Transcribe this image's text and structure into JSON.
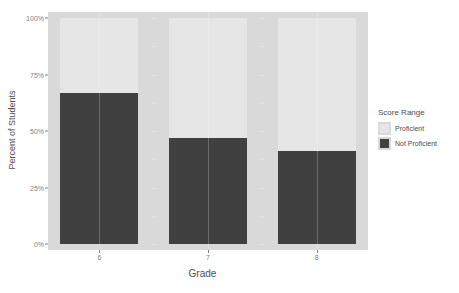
{
  "chart_data": {
    "type": "bar",
    "title": "",
    "xlabel": "Grade",
    "ylabel": "Percent of Students",
    "categories": [
      "6",
      "7",
      "8"
    ],
    "ylim": [
      0,
      100
    ],
    "y_ticks": [
      {
        "value": 0,
        "label": "0%"
      },
      {
        "value": 25,
        "label": "25%"
      },
      {
        "value": 50,
        "label": "50%"
      },
      {
        "value": 75,
        "label": "75%"
      },
      {
        "value": 100,
        "label": "100%"
      }
    ],
    "stacked": true,
    "grid": true,
    "legend_position": "right",
    "legend_title": "Score Range",
    "series": [
      {
        "name": "Proficient",
        "color": "#e6e6e6",
        "values": [
          33,
          53,
          59
        ]
      },
      {
        "name": "Not Proficient",
        "color": "#404040",
        "values": [
          67,
          47,
          41
        ]
      }
    ],
    "facets": [
      {
        "label": "6",
        "proficient": 33,
        "not_proficient": 67
      },
      {
        "label": "7",
        "proficient": 53,
        "not_proficient": 47
      },
      {
        "label": "8",
        "proficient": 59,
        "not_proficient": 41
      }
    ]
  },
  "legend": {
    "title": "Score Range",
    "items": [
      {
        "label": "Proficient",
        "color": "#e6e6e6"
      },
      {
        "label": "Not Proficient",
        "color": "#404040"
      }
    ]
  },
  "axes": {
    "x_title": "Grade",
    "y_title": "Percent of Students"
  }
}
